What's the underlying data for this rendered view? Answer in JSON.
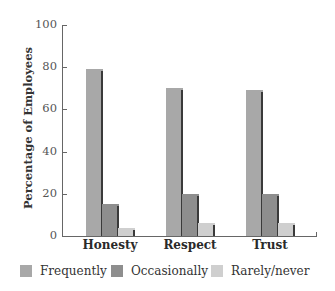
{
  "chart_data": {
    "type": "bar",
    "title": "",
    "xlabel": "",
    "ylabel": "Percentage of Employees",
    "ylim": [
      0,
      100
    ],
    "yticks": [
      0,
      20,
      40,
      60,
      80,
      100
    ],
    "grid": false,
    "legend_position": "bottom",
    "categories": [
      "Honesty",
      "Respect",
      "Trust"
    ],
    "series": [
      {
        "name": "Frequently",
        "color": "#a8a8a8",
        "values": [
          79,
          70,
          69
        ]
      },
      {
        "name": "Occasionally",
        "color": "#8e8e8e",
        "values": [
          15,
          20,
          20
        ]
      },
      {
        "name": "Rarely/never",
        "color": "#cfcfcf",
        "values": [
          4,
          6,
          6
        ]
      }
    ]
  },
  "axis": {
    "ylabel": "Percentage of Employees",
    "ticks": [
      "0",
      "20",
      "40",
      "60",
      "80",
      "100"
    ]
  },
  "categories": [
    "Honesty",
    "Respect",
    "Trust"
  ],
  "legend": [
    {
      "label": "Frequently",
      "color": "#a8a8a8"
    },
    {
      "label": "Occasionally",
      "color": "#8e8e8e"
    },
    {
      "label": "Rarely/never",
      "color": "#cfcfcf"
    }
  ]
}
